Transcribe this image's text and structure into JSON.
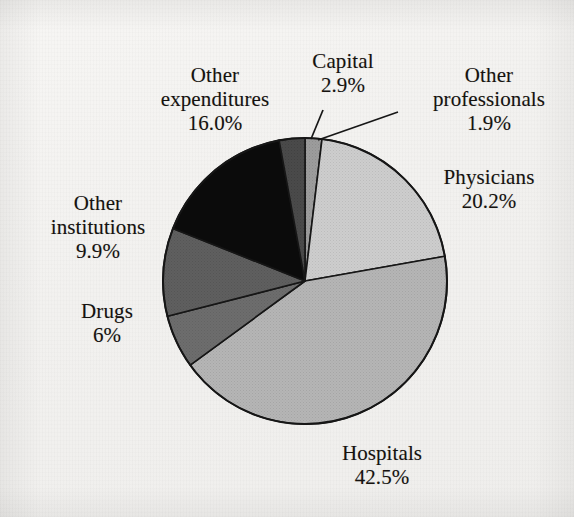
{
  "chart_data": {
    "type": "pie",
    "title": "",
    "subtitle": "",
    "xlabel": "",
    "ylabel": "",
    "legend_position": "none",
    "grid": false,
    "labels_outside": true,
    "start_angle_deg": 0,
    "direction": "clockwise",
    "categories": [
      "Other professionals",
      "Physicians",
      "Hospitals",
      "Drugs",
      "Other institutions",
      "Other expenditures",
      "Capital"
    ],
    "values": [
      1.9,
      20.2,
      42.5,
      6.0,
      9.9,
      16.0,
      2.9
    ],
    "value_unit": "%",
    "slices": [
      {
        "name": "Other professionals",
        "value": 1.9,
        "value_text": "1.9%",
        "color": "#9c9c9c",
        "label_lines": [
          "Other",
          "professionals",
          "1.9%"
        ],
        "has_leader_line": true
      },
      {
        "name": "Physicians",
        "value": 20.2,
        "value_text": "20.2%",
        "color": "#c6c6c6",
        "label_lines": [
          "Physicians",
          "20.2%"
        ],
        "has_leader_line": false
      },
      {
        "name": "Hospitals",
        "value": 42.5,
        "value_text": "42.5%",
        "color": "#b1b1b1",
        "label_lines": [
          "Hospitals",
          "42.5%"
        ],
        "has_leader_line": false
      },
      {
        "name": "Drugs",
        "value": 6.0,
        "value_text": "6%",
        "color": "#6b6b6b",
        "label_lines": [
          "Drugs",
          "6%"
        ],
        "has_leader_line": false
      },
      {
        "name": "Other institutions",
        "value": 9.9,
        "value_text": "9.9%",
        "color": "#5f5f5f",
        "label_lines": [
          "Other",
          "institutions",
          "9.9%"
        ],
        "has_leader_line": false
      },
      {
        "name": "Other expenditures",
        "value": 16.0,
        "value_text": "16.0%",
        "color": "#0b0b0b",
        "label_lines": [
          "Other",
          "expenditures",
          "16.0%"
        ],
        "has_leader_line": false
      },
      {
        "name": "Capital",
        "value": 2.9,
        "value_text": "2.9%",
        "color": "#4a4a4a",
        "label_lines": [
          "Capital",
          "2.9%"
        ],
        "has_leader_line": true
      }
    ]
  },
  "labels": {
    "capital": {
      "name": "Capital",
      "value": "2.9%"
    },
    "other_expenditures": {
      "name_line1": "Other",
      "name_line2": "expenditures",
      "value": "16.0%"
    },
    "other_professionals": {
      "name_line1": "Other",
      "name_line2": "professionals",
      "value": "1.9%"
    },
    "physicians": {
      "name": "Physicians",
      "value": "20.2%"
    },
    "other_institutions": {
      "name_line1": "Other",
      "name_line2": "institutions",
      "value": "9.9%"
    },
    "drugs": {
      "name": "Drugs",
      "value": "6%"
    },
    "hospitals": {
      "name": "Hospitals",
      "value": "42.5%"
    }
  },
  "colors": {
    "background": "#f4f3f1",
    "outline": "#161616",
    "text": "#15120f",
    "physicians": "#c6c6c6",
    "hospitals": "#b1b1b1",
    "drugs": "#6b6b6b",
    "other_institutions": "#5f5f5f",
    "other_expenditures": "#0b0b0b",
    "capital": "#4a4a4a",
    "other_professionals": "#9c9c9c"
  },
  "geometry": {
    "center_x": 305,
    "center_y": 281,
    "radius_x": 142,
    "radius_y": 143
  }
}
